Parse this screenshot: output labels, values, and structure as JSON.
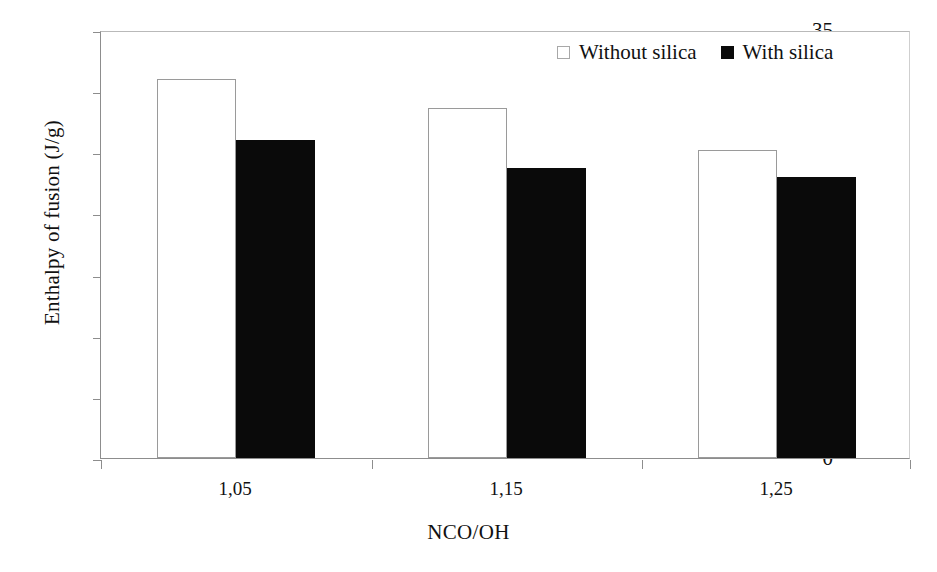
{
  "chart_data": {
    "type": "bar",
    "title": "",
    "xlabel": "NCO/OH",
    "ylabel": "Enthalpy of fusion (J/g)",
    "categories": [
      "1,05",
      "1,15",
      "1,25"
    ],
    "series": [
      {
        "name": "Without silica",
        "color": "#ffffff",
        "values": [
          31.0,
          28.6,
          25.2
        ]
      },
      {
        "name": "With silica",
        "color": "#000000",
        "values": [
          26.0,
          23.7,
          23.0
        ]
      }
    ],
    "ylim": [
      0,
      35
    ],
    "ytick_labels": [
      "0",
      "5",
      "10",
      "15",
      "20",
      "25",
      "30",
      "35"
    ],
    "ytick_values": [
      0,
      5,
      10,
      15,
      20,
      25,
      30,
      35
    ],
    "grid": false,
    "legend_position": "top-right"
  },
  "legend": {
    "entries": [
      {
        "label": "Without silica",
        "swatch": "empty-square-icon"
      },
      {
        "label": "With silica",
        "swatch": "filled-square-icon"
      }
    ]
  }
}
